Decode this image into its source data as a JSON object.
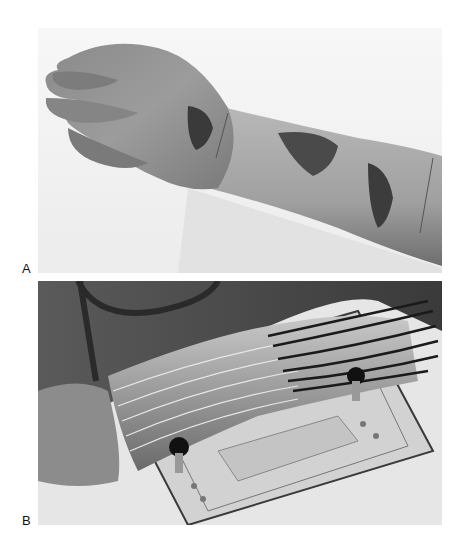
{
  "figure": {
    "panels": [
      {
        "label": "A",
        "description": "Photograph of forearm and hand with ulcerated wounds on dorsal wrist and forearm"
      },
      {
        "label": "B",
        "description": "Photograph of forearm inside transparent plastic sleeve with multiple tubes, resting on acrylic platform with knobs"
      }
    ]
  }
}
